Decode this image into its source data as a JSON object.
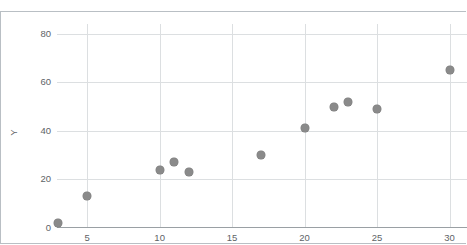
{
  "top_partial_text": "·",
  "axis_title_y": "Y",
  "axis_title_x": "",
  "marker_color": "#8a8a8a",
  "grid_color": "#dcdfe1",
  "axis_color": "#9aa0a4",
  "frame_color": "#b9bfc4",
  "tick_text_color": "#5e6366",
  "chart_data": {
    "type": "scatter",
    "title": "",
    "xlabel": "",
    "ylabel": "Y",
    "xlim": [
      2.92,
      31.2
    ],
    "ylim": [
      0,
      84
    ],
    "grid": true,
    "legend": "none",
    "xticks": [
      5,
      10,
      15,
      20,
      25,
      30
    ],
    "yticks": [
      0,
      20,
      40,
      60,
      80
    ],
    "xtick_labels": [
      "5",
      "10",
      "15",
      "20",
      "25",
      "30"
    ],
    "ytick_labels": [
      "0",
      "20",
      "40",
      "60",
      "80"
    ],
    "series": [
      {
        "name": "Y",
        "marker": "circle",
        "color": "#8a8a8a",
        "points": [
          {
            "x": 3,
            "y": 2
          },
          {
            "x": 5,
            "y": 13
          },
          {
            "x": 10,
            "y": 24
          },
          {
            "x": 11,
            "y": 27
          },
          {
            "x": 12,
            "y": 23
          },
          {
            "x": 17,
            "y": 30
          },
          {
            "x": 20,
            "y": 41
          },
          {
            "x": 22,
            "y": 50
          },
          {
            "x": 23,
            "y": 52
          },
          {
            "x": 25,
            "y": 49
          },
          {
            "x": 30,
            "y": 65
          }
        ]
      }
    ]
  }
}
